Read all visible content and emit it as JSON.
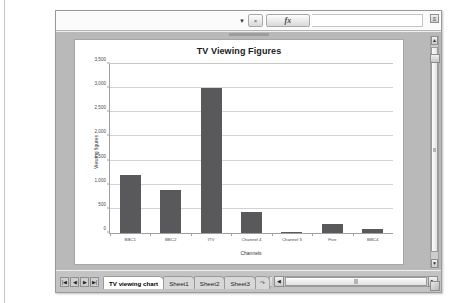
{
  "window": {
    "formula_bar": {
      "name_box_value": "",
      "name_box_arrow": "▼",
      "cancel_label": "×",
      "fx_label": "fx",
      "formula_value": "",
      "corner_label": "≡"
    }
  },
  "sheet_tabs": {
    "nav_first": "|◀",
    "nav_prev": "◀",
    "nav_next": "▶",
    "nav_last": "▶|",
    "tabs": [
      {
        "label": "TV viewing chart",
        "active": true
      },
      {
        "label": "Sheet1",
        "active": false
      },
      {
        "label": "Sheet2",
        "active": false
      },
      {
        "label": "Sheet3",
        "active": false
      }
    ],
    "new_sheet_label": "↷"
  },
  "scrollbars": {
    "v_up": "▲",
    "v_down": "▼",
    "h_left": "◀",
    "h_right": "▶"
  },
  "chart_data": {
    "type": "bar",
    "title": "TV Viewing Figures",
    "xlabel": "Channels",
    "ylabel": "Viewing figures",
    "categories": [
      "BBC1",
      "BBC2",
      "ITV",
      "Channel 4",
      "Channel 5",
      "Five",
      "BBC4"
    ],
    "values": [
      1200,
      900,
      3000,
      430,
      20,
      180,
      80
    ],
    "ylim": [
      0,
      3500
    ],
    "yticks": [
      0,
      500,
      1000,
      1500,
      2000,
      2500,
      3000,
      3500
    ],
    "ytick_labels": [
      "0",
      "500",
      "1,000",
      "1,500",
      "2,000",
      "2,500",
      "3,000",
      "3,500"
    ],
    "grid": true,
    "legend": false,
    "bar_color": "#59595b",
    "grid_color": "#d2d2d2",
    "axis_color": "#9f9f9f"
  }
}
